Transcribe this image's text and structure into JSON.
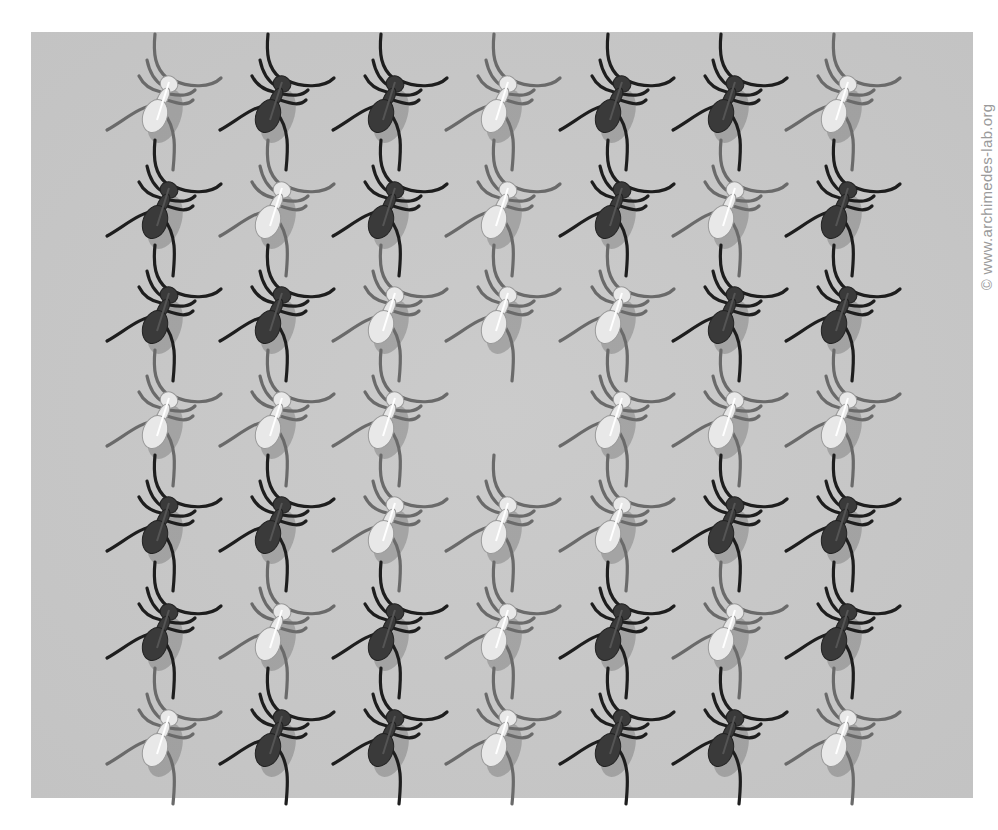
{
  "illusion": {
    "title": "Ant grid illusion",
    "credit": "© www.archimedes-lab.org",
    "background_color": "#c6c6c6",
    "columns": 7,
    "rows": 7,
    "grid": [
      [
        "light",
        "dark",
        "dark",
        "light",
        "dark",
        "dark",
        "light"
      ],
      [
        "dark",
        "light",
        "dark",
        "light",
        "dark",
        "light",
        "dark"
      ],
      [
        "dark",
        "dark",
        "light",
        "light",
        "light",
        "dark",
        "dark"
      ],
      [
        "light",
        "light",
        "light",
        "empty",
        "light",
        "light",
        "light"
      ],
      [
        "dark",
        "dark",
        "light",
        "light",
        "light",
        "dark",
        "dark"
      ],
      [
        "dark",
        "light",
        "dark",
        "light",
        "dark",
        "light",
        "dark"
      ],
      [
        "light",
        "dark",
        "dark",
        "light",
        "dark",
        "dark",
        "light"
      ]
    ],
    "colors": {
      "dark_body": "#3a3a3a",
      "dark_leg": "#1e1e1e",
      "light_body": "#e8e8e8",
      "light_leg": "#6a6a6a",
      "shadow": "rgba(0,0,0,0.18)"
    }
  }
}
